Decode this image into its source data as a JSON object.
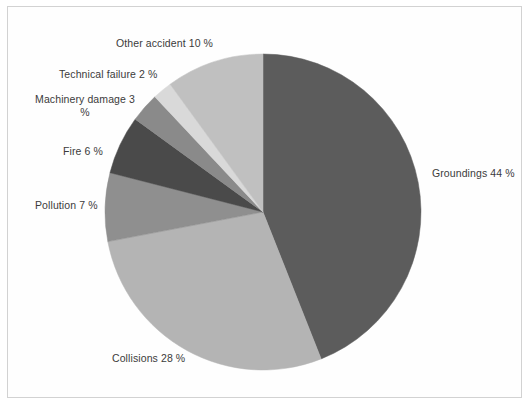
{
  "figure": {
    "background_color": "#ffffff",
    "frame_color": "#d2d2d2",
    "label_text_color": "#3b3b3b"
  },
  "chart_data": {
    "type": "pie",
    "title": "",
    "subtitle": "",
    "xlabel": "",
    "ylabel": "",
    "grid": false,
    "legend_position": "none",
    "labels_position": "outside-callout-text",
    "units": "%",
    "start_angle_deg": 0,
    "direction": "clockwise",
    "total": 100,
    "categories": [
      "Groundings",
      "Collisions",
      "Pollution",
      "Fire",
      "Machinery damage",
      "Technical failure",
      "Other accident"
    ],
    "values": [
      44,
      28,
      7,
      6,
      3,
      2,
      10
    ],
    "colors": [
      "#5c5c5c",
      "#b4b4b4",
      "#8f8f8f",
      "#4a4a4a",
      "#8a8a8a",
      "#d9d9d9",
      "#c0c0c0"
    ],
    "slices": [
      {
        "label": "Groundings",
        "value": 44,
        "text": "Groundings 44 %",
        "color": "#5c5c5c"
      },
      {
        "label": "Collisions",
        "value": 28,
        "text": "Collisions 28 %",
        "color": "#b4b4b4"
      },
      {
        "label": "Pollution",
        "value": 7,
        "text": "Pollution 7 %",
        "color": "#8f8f8f"
      },
      {
        "label": "Fire",
        "value": 6,
        "text": "Fire 6 %",
        "color": "#4a4a4a"
      },
      {
        "label": "Machinery damage",
        "value": 3,
        "text": "Machinery damage\n3 %",
        "color": "#8a8a8a"
      },
      {
        "label": "Technical failure",
        "value": 2,
        "text": "Technical failure 2 %",
        "color": "#d9d9d9"
      },
      {
        "label": "Other accident",
        "value": 10,
        "text": "Other accident 10 %",
        "color": "#c0c0c0"
      }
    ],
    "geometry": {
      "center_x": 263,
      "center_y": 212,
      "radius": 158
    }
  },
  "labels": {
    "groundings": "Groundings 44 %",
    "collisions": "Collisions 28 %",
    "pollution": "Pollution 7 %",
    "fire": "Fire 6 %",
    "machinery_damage": "Machinery damage 3 %",
    "technical_failure": "Technical failure 2 %",
    "other_accident": "Other accident 10 %"
  }
}
